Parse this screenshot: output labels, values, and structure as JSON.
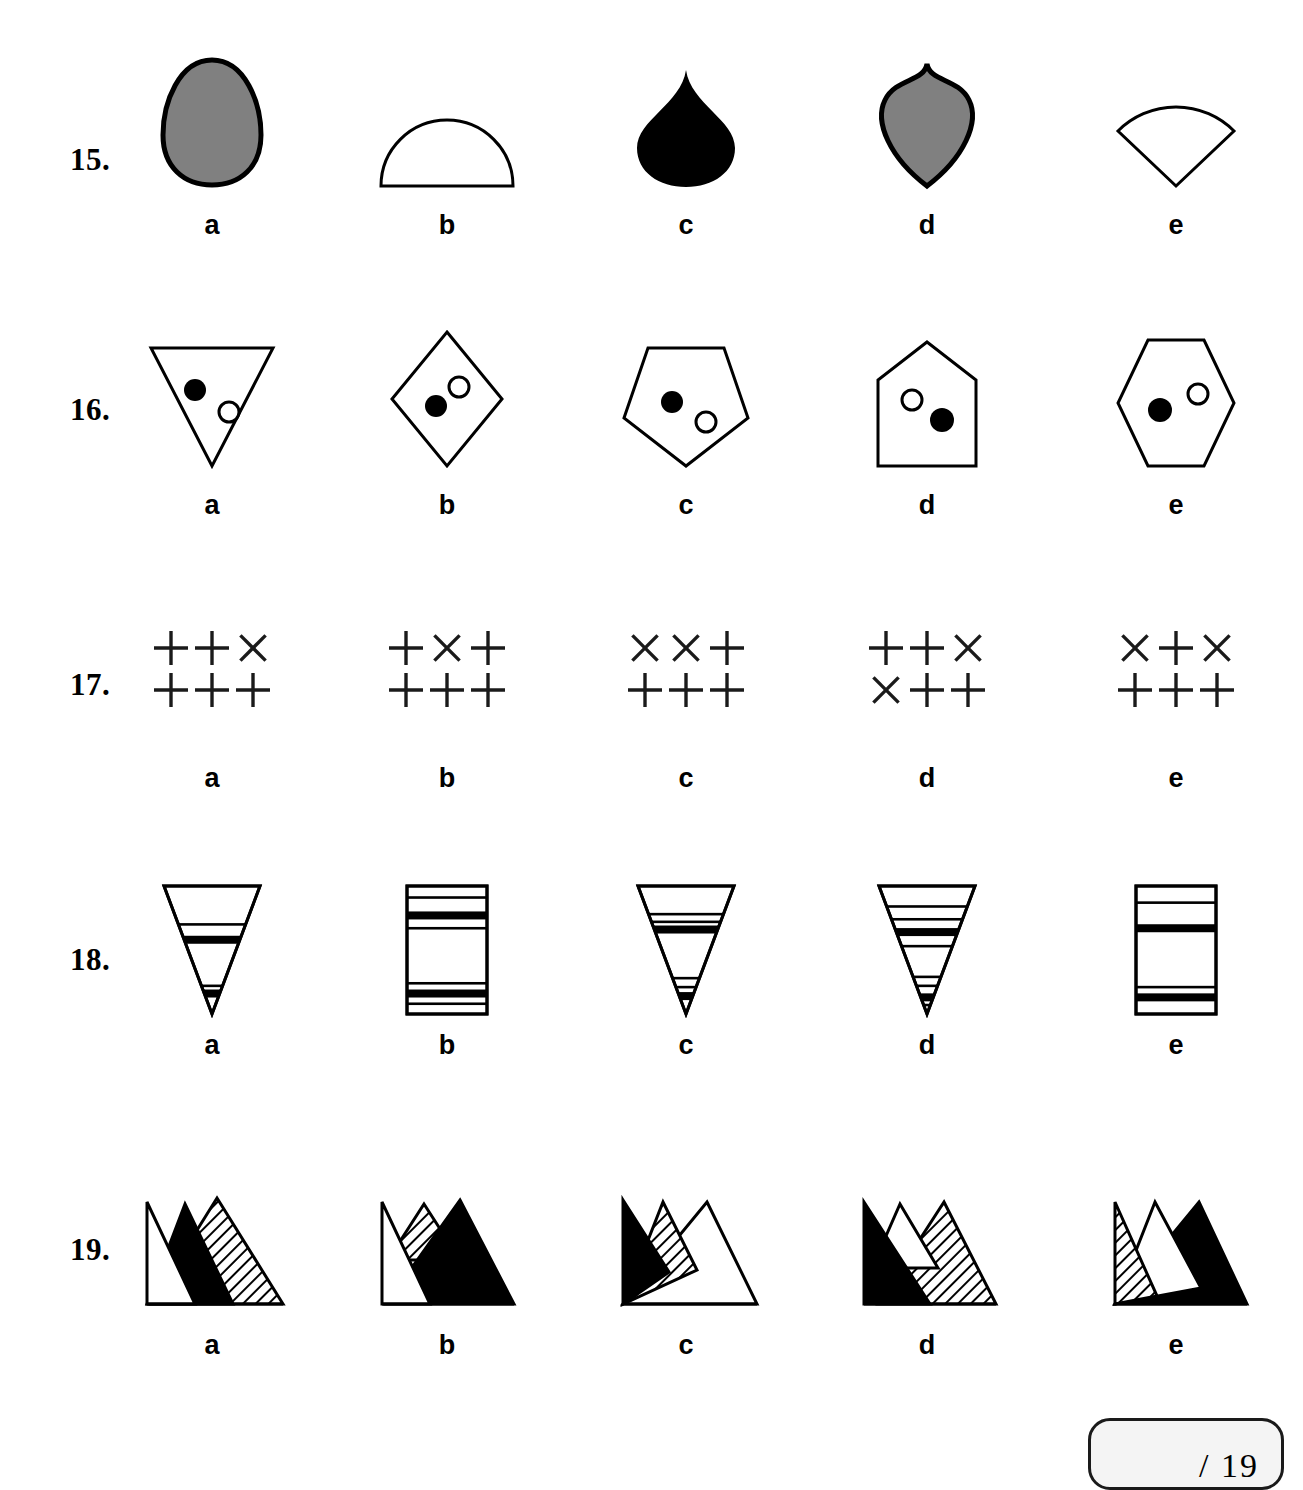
{
  "page": {
    "background": "#ffffff",
    "ink": "#000000",
    "gray_fill": "#808080"
  },
  "score_box": {
    "text": "/ 19",
    "total": 19,
    "fill": "#f4f4f4",
    "border": "#1a1a1a"
  },
  "option_letters": [
    "a",
    "b",
    "c",
    "d",
    "e"
  ],
  "questions": [
    {
      "number": "15.",
      "kind": "silhouette-shapes",
      "options": [
        {
          "letter": "a",
          "shape": "egg-oval",
          "fill": "gray"
        },
        {
          "letter": "b",
          "shape": "semicircle",
          "fill": "white"
        },
        {
          "letter": "c",
          "shape": "teardrop",
          "fill": "black"
        },
        {
          "letter": "d",
          "shape": "pointed-shield",
          "fill": "gray"
        },
        {
          "letter": "e",
          "shape": "pie-wedge",
          "fill": "white"
        }
      ]
    },
    {
      "number": "16.",
      "kind": "polygon-with-two-dots",
      "options": [
        {
          "letter": "a",
          "shape": "triangle-down",
          "dots": [
            {
              "type": "filled",
              "pos": "upper-left"
            },
            {
              "type": "open",
              "pos": "lower-right"
            }
          ]
        },
        {
          "letter": "b",
          "shape": "diamond",
          "dots": [
            {
              "type": "open",
              "pos": "upper-right"
            },
            {
              "type": "filled",
              "pos": "lower-left"
            }
          ]
        },
        {
          "letter": "c",
          "shape": "pentagon",
          "dots": [
            {
              "type": "filled",
              "pos": "upper-left"
            },
            {
              "type": "open",
              "pos": "lower-right"
            }
          ]
        },
        {
          "letter": "d",
          "shape": "house",
          "dots": [
            {
              "type": "open",
              "pos": "upper-left"
            },
            {
              "type": "filled",
              "pos": "lower-right"
            }
          ]
        },
        {
          "letter": "e",
          "shape": "hexagon-vertical",
          "dots": [
            {
              "type": "filled",
              "pos": "left"
            },
            {
              "type": "open",
              "pos": "upper-right"
            }
          ]
        }
      ]
    },
    {
      "number": "17.",
      "kind": "plus-cross-grid",
      "grid_size": {
        "rows": 2,
        "cols": 3
      },
      "options": [
        {
          "letter": "a",
          "grid": [
            [
              "+",
              "+",
              "x"
            ],
            [
              "+",
              "+",
              "+"
            ]
          ]
        },
        {
          "letter": "b",
          "grid": [
            [
              "+",
              "x",
              "+"
            ],
            [
              "+",
              "+",
              "+"
            ]
          ]
        },
        {
          "letter": "c",
          "grid": [
            [
              "x",
              "x",
              "+"
            ],
            [
              "+",
              "+",
              "+"
            ]
          ]
        },
        {
          "letter": "d",
          "grid": [
            [
              "+",
              "+",
              "x"
            ],
            [
              "x",
              "+",
              "+"
            ]
          ]
        },
        {
          "letter": "e",
          "grid": [
            [
              "x",
              "+",
              "x"
            ],
            [
              "+",
              "+",
              "+"
            ]
          ]
        }
      ]
    },
    {
      "number": "18.",
      "kind": "banded-shape",
      "options": [
        {
          "letter": "a",
          "shape": "triangle-down",
          "bands": [
            {
              "y": 0.3,
              "weight": "thin"
            },
            {
              "y": 0.42,
              "weight": "thick"
            },
            {
              "y": 0.78,
              "weight": "thin"
            },
            {
              "y": 0.84,
              "weight": "thick"
            }
          ]
        },
        {
          "letter": "b",
          "shape": "rectangle",
          "bands": [
            {
              "y": 0.09,
              "weight": "thin"
            },
            {
              "y": 0.23,
              "weight": "thick"
            },
            {
              "y": 0.33,
              "weight": "thin"
            },
            {
              "y": 0.76,
              "weight": "thin"
            },
            {
              "y": 0.84,
              "weight": "thick"
            },
            {
              "y": 0.92,
              "weight": "thin"
            }
          ]
        },
        {
          "letter": "c",
          "shape": "triangle-down",
          "bands": [
            {
              "y": 0.22,
              "weight": "thin"
            },
            {
              "y": 0.28,
              "weight": "thin"
            },
            {
              "y": 0.34,
              "weight": "thick"
            },
            {
              "y": 0.72,
              "weight": "thin"
            },
            {
              "y": 0.79,
              "weight": "thin"
            },
            {
              "y": 0.86,
              "weight": "thick"
            }
          ]
        },
        {
          "letter": "d",
          "shape": "triangle-down",
          "bands": [
            {
              "y": 0.16,
              "weight": "thin"
            },
            {
              "y": 0.26,
              "weight": "thin"
            },
            {
              "y": 0.36,
              "weight": "thick"
            },
            {
              "y": 0.47,
              "weight": "thin"
            },
            {
              "y": 0.71,
              "weight": "thin"
            },
            {
              "y": 0.78,
              "weight": "thin"
            },
            {
              "y": 0.87,
              "weight": "thick"
            },
            {
              "y": 0.93,
              "weight": "thin"
            }
          ]
        },
        {
          "letter": "e",
          "shape": "rectangle",
          "bands": [
            {
              "y": 0.13,
              "weight": "thin"
            },
            {
              "y": 0.33,
              "weight": "thick"
            },
            {
              "y": 0.79,
              "weight": "thin"
            },
            {
              "y": 0.87,
              "weight": "thick"
            }
          ]
        }
      ]
    },
    {
      "number": "19.",
      "kind": "overlapping-mountains",
      "fills": [
        "white",
        "black",
        "hatched"
      ],
      "options": [
        {
          "letter": "a",
          "peaks": [
            {
              "fill": "white",
              "size": "tall-narrow",
              "order": "left"
            },
            {
              "fill": "black",
              "size": "medium",
              "order": "middle"
            },
            {
              "fill": "hatched",
              "size": "large",
              "order": "right"
            }
          ]
        },
        {
          "letter": "b",
          "peaks": [
            {
              "fill": "white",
              "size": "tall-narrow",
              "order": "left"
            },
            {
              "fill": "hatched",
              "size": "small",
              "order": "middle"
            },
            {
              "fill": "black",
              "size": "large",
              "order": "right"
            }
          ]
        },
        {
          "letter": "c",
          "peaks": [
            {
              "fill": "black",
              "size": "medium",
              "order": "left"
            },
            {
              "fill": "hatched",
              "size": "medium",
              "order": "middle"
            },
            {
              "fill": "white",
              "size": "large",
              "order": "right"
            }
          ]
        },
        {
          "letter": "d",
          "peaks": [
            {
              "fill": "black",
              "size": "large",
              "order": "left"
            },
            {
              "fill": "white",
              "size": "small",
              "order": "middle"
            },
            {
              "fill": "hatched",
              "size": "large",
              "order": "right"
            }
          ]
        },
        {
          "letter": "e",
          "peaks": [
            {
              "fill": "hatched",
              "size": "medium",
              "order": "left"
            },
            {
              "fill": "white",
              "size": "medium",
              "order": "middle"
            },
            {
              "fill": "black",
              "size": "large",
              "order": "right"
            }
          ]
        }
      ]
    }
  ]
}
